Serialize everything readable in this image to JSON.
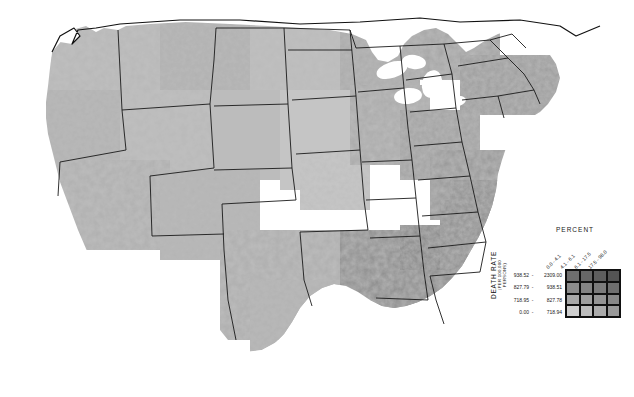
{
  "figure": {
    "type": "choropleth-map",
    "region": "United States",
    "unit": "county",
    "background": "#ffffff",
    "palette": "grayscale"
  },
  "legend": {
    "percent_title": "PERCENT",
    "death_rate_title": "DEATH RATE",
    "death_rate_subtitle": "(PER 100,000 PERSONS)",
    "column_labels": [
      "0.0 - 4.1",
      "4.1 - 6.1",
      "6.1 - 17.5",
      "17.5 - 98.0"
    ],
    "row_labels": [
      {
        "lo": "938.52",
        "dash": "-",
        "hi": "2309.00"
      },
      {
        "lo": "827.79",
        "dash": "-",
        "hi": "938.51"
      },
      {
        "lo": "718.95",
        "dash": "-",
        "hi": "827.78"
      },
      {
        "lo": "0.00",
        "dash": "-",
        "hi": "718.94"
      }
    ],
    "grid_colors": [
      [
        "#6f6f6f",
        "#676767",
        "#5e5e5e",
        "#545454"
      ],
      [
        "#8c8c8c",
        "#848484",
        "#7b7b7b",
        "#6f6f6f"
      ],
      [
        "#a8a8a8",
        "#9f9f9f",
        "#949494",
        "#888888"
      ],
      [
        "#cfcfcf",
        "#bdbdbd",
        "#ababab",
        "#9a9a9a"
      ]
    ]
  },
  "chart_data": {
    "type": "heatmap",
    "title": "",
    "xlabel": "PERCENT",
    "ylabel": "DEATH RATE (PER 100,000 PERSONS)",
    "x_categories": [
      "0.0 - 4.1",
      "4.1 - 6.1",
      "6.1 - 17.5",
      "17.5 - 98.0"
    ],
    "y_categories": [
      "938.52 - 2309.00",
      "827.79 - 938.51",
      "718.95 - 827.78",
      "0.00 - 718.94"
    ],
    "values": [
      [
        4,
        5,
        6,
        7
      ],
      [
        3,
        4,
        5,
        6
      ],
      [
        2,
        3,
        4,
        5
      ],
      [
        1,
        2,
        3,
        4
      ]
    ],
    "legend_position": "right",
    "grid": true,
    "regional_summary": [
      {
        "region": "Southeast",
        "shade": "darkest",
        "note": "highest death rate band"
      },
      {
        "region": "Appalachia",
        "shade": "dark"
      },
      {
        "region": "Great Plains",
        "shade": "light"
      },
      {
        "region": "Mountain West",
        "shade": "light-to-mid"
      },
      {
        "region": "Florida peninsula",
        "shade": "dark"
      },
      {
        "region": "Northeast corridor",
        "shade": "mid-to-dark"
      }
    ]
  }
}
